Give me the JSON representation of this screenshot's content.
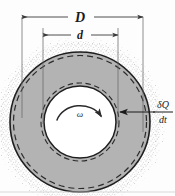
{
  "figure": {
    "canvas": {
      "width": 175,
      "height": 196,
      "background": "#fdfdfd"
    },
    "labels": {
      "outer_diameter": "D",
      "inner_diameter": "d",
      "angular_velocity": "ω",
      "heat_rate_numerator": "δQ",
      "heat_rate_denominator": "dt"
    },
    "colors": {
      "annulus_fill": "#b3b3b3",
      "hub_fill": "#ffffff",
      "outline": "#1f1f1f",
      "dashed_line": "#2b2b2b",
      "stipple": "#9a9a9a",
      "dimension_line": "#3a3a3a",
      "background": "#fdfdfd"
    },
    "geometry": {
      "center_x": 80,
      "center_y": 122,
      "outer_radius": 70,
      "inner_radius": 36,
      "halo_radius": 80,
      "dim_D_y": 17,
      "dim_D_x1": 22,
      "dim_D_x2": 143,
      "dim_d_y": 35,
      "dim_d_x1": 43,
      "dim_d_x2": 118
    }
  }
}
